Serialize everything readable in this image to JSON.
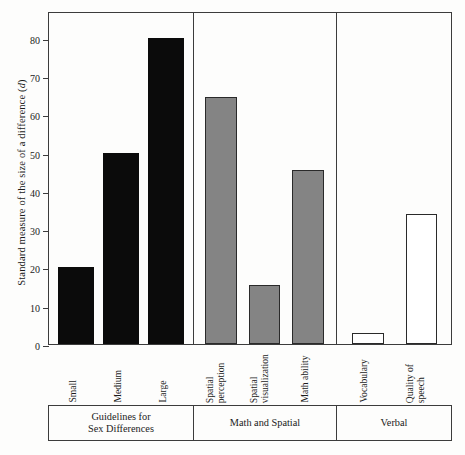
{
  "chart_data": {
    "type": "bar",
    "title": "",
    "xlabel": "",
    "ylabel": "Standard measure of the size of a difference (d)",
    "ylim": [
      0,
      87
    ],
    "yticks": [
      0,
      10,
      20,
      30,
      40,
      50,
      60,
      70,
      80
    ],
    "grid": false,
    "legend": "none",
    "categories": [
      "Small",
      "Medium",
      "Large",
      "Spatial perception",
      "Spatial visualization",
      "Math ability",
      "Vocabulary",
      "Quality of speech"
    ],
    "values": [
      20,
      50,
      80,
      64.5,
      15.5,
      45.5,
      3,
      34
    ],
    "groups": [
      {
        "name": "Guidelines for Sex Differences",
        "fill": "black",
        "categories": [
          "Small",
          "Medium",
          "Large"
        ],
        "values": [
          20,
          50,
          80
        ]
      },
      {
        "name": "Math and Spatial",
        "fill": "gray",
        "categories": [
          "Spatial perception",
          "Spatial visualization",
          "Math ability"
        ],
        "values": [
          64.5,
          15.5,
          45.5
        ]
      },
      {
        "name": "Verbal",
        "fill": "white",
        "categories": [
          "Vocabulary",
          "Quality of speech"
        ],
        "values": [
          3,
          34
        ]
      }
    ],
    "colors": {
      "black": "#0b0b0b",
      "gray": "#848484",
      "white": "#ffffff",
      "outline": "#2a2a2a",
      "axis": "#3c3c3c"
    }
  },
  "axis": {
    "y_title_pre": "Standard measure of the size of a difference (",
    "y_title_italic": "d",
    "y_title_post": ")",
    "ticks": [
      "80",
      "70",
      "60",
      "50",
      "40",
      "30",
      "20",
      "10",
      "0"
    ]
  },
  "bars": [
    {
      "label": "Small",
      "label_line2": "",
      "value": 20,
      "fill": "black"
    },
    {
      "label": "Medium",
      "label_line2": "",
      "value": 50,
      "fill": "black"
    },
    {
      "label": "Large",
      "label_line2": "",
      "value": 80,
      "fill": "black"
    },
    {
      "label": "Spatial",
      "label_line2": "perception",
      "value": 64.5,
      "fill": "gray"
    },
    {
      "label": "Spatial",
      "label_line2": "visualization",
      "value": 15.5,
      "fill": "gray"
    },
    {
      "label": "Math ability",
      "label_line2": "",
      "value": 45.5,
      "fill": "gray"
    },
    {
      "label": "Vocabulary",
      "label_line2": "",
      "value": 3,
      "fill": "white"
    },
    {
      "label": "Quality of",
      "label_line2": "speech",
      "value": 34,
      "fill": "white"
    }
  ],
  "groups": [
    {
      "line1": "Guidelines for",
      "line2": "Sex Differences"
    },
    {
      "line1": "Math and Spatial",
      "line2": ""
    },
    {
      "line1": "Verbal",
      "line2": ""
    }
  ]
}
